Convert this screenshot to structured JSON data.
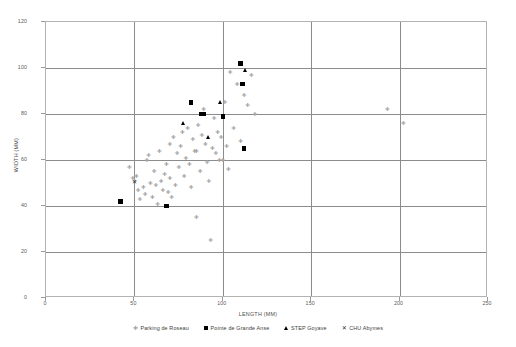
{
  "chart_data": {
    "type": "scatter",
    "title": "",
    "xlabel": "LENGTH (MM)",
    "ylabel": "WIDTH (MM)",
    "xlim": [
      0,
      250
    ],
    "ylim": [
      0,
      120
    ],
    "xticks": [
      0,
      50,
      100,
      150,
      200,
      250
    ],
    "yticks": [
      0,
      20,
      40,
      60,
      80,
      100,
      120
    ],
    "grid": true,
    "legend_position": "bottom",
    "series": [
      {
        "name": "Parking de Roseau",
        "marker": "cross",
        "color": "#a6a6a6",
        "points": [
          [
            47,
            57
          ],
          [
            49,
            52
          ],
          [
            50,
            51
          ],
          [
            51,
            53
          ],
          [
            52,
            47
          ],
          [
            53,
            43
          ],
          [
            55,
            48
          ],
          [
            56,
            45
          ],
          [
            57,
            60
          ],
          [
            58,
            62
          ],
          [
            59,
            50
          ],
          [
            60,
            44
          ],
          [
            61,
            55
          ],
          [
            62,
            49
          ],
          [
            63,
            41
          ],
          [
            64,
            64
          ],
          [
            65,
            51
          ],
          [
            66,
            47
          ],
          [
            67,
            54
          ],
          [
            68,
            58
          ],
          [
            69,
            46
          ],
          [
            70,
            67
          ],
          [
            70,
            52
          ],
          [
            71,
            44
          ],
          [
            72,
            70
          ],
          [
            73,
            49
          ],
          [
            74,
            63
          ],
          [
            75,
            57
          ],
          [
            76,
            66
          ],
          [
            77,
            72
          ],
          [
            78,
            53
          ],
          [
            79,
            61
          ],
          [
            80,
            74
          ],
          [
            81,
            58
          ],
          [
            82,
            48
          ],
          [
            83,
            69
          ],
          [
            84,
            64
          ],
          [
            85,
            64
          ],
          [
            85,
            35
          ],
          [
            86,
            75
          ],
          [
            87,
            55
          ],
          [
            88,
            71
          ],
          [
            89,
            82
          ],
          [
            90,
            67
          ],
          [
            91,
            59
          ],
          [
            92,
            51
          ],
          [
            93,
            25
          ],
          [
            94,
            65
          ],
          [
            95,
            78
          ],
          [
            96,
            63
          ],
          [
            97,
            72
          ],
          [
            98,
            60
          ],
          [
            99,
            70
          ],
          [
            100,
            60
          ],
          [
            101,
            85
          ],
          [
            102,
            66
          ],
          [
            103,
            56
          ],
          [
            104,
            98
          ],
          [
            106,
            74
          ],
          [
            108,
            93
          ],
          [
            110,
            68
          ],
          [
            112,
            88
          ],
          [
            114,
            84
          ],
          [
            116,
            97
          ],
          [
            118,
            80
          ],
          [
            193,
            82
          ],
          [
            202,
            76
          ]
        ]
      },
      {
        "name": "Pointe de Grande Anse",
        "marker": "square",
        "color": "#000000",
        "points": [
          [
            42,
            42
          ],
          [
            68,
            40
          ],
          [
            82,
            85
          ],
          [
            88,
            80
          ],
          [
            89,
            80
          ],
          [
            100,
            79
          ],
          [
            110,
            102
          ],
          [
            111,
            93
          ],
          [
            112,
            65
          ]
        ]
      },
      {
        "name": "STEP Goyave",
        "marker": "triangle",
        "color": "#000000",
        "points": [
          [
            78,
            76
          ],
          [
            92,
            70
          ],
          [
            99,
            85
          ],
          [
            113,
            99
          ]
        ]
      },
      {
        "name": "CHU Abymes",
        "marker": "x",
        "color": "#2b2b2b",
        "points": [
          [
            50,
            50
          ]
        ]
      }
    ]
  }
}
